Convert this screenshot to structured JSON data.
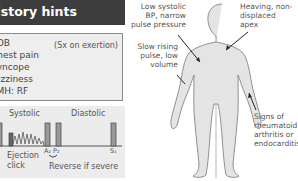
{
  "header": {
    "title": "History hints"
  },
  "history": {
    "items": [
      "SOB",
      "Chest pain",
      "Syncope",
      "Dizziness",
      "PMH: RF"
    ],
    "note": "(Sx on exertion)"
  },
  "murmur": {
    "systolic_label": "Systolic",
    "diastolic_label": "Diastolic",
    "ejection_click_label": "Ejection click",
    "a2_label": "A₂",
    "p2_label": "P₂",
    "s1_label": "S₁",
    "reverse_label": "Reverse if severe"
  },
  "figure": {
    "annotations": {
      "bp": "Low systolic BP, narrow pulse pressure",
      "pulse": "Slow rising pulse, low volume",
      "apex": "Heaving, non-displaced apex",
      "signs": "Signs of rheumatoid arthritis or endocarditis"
    }
  }
}
